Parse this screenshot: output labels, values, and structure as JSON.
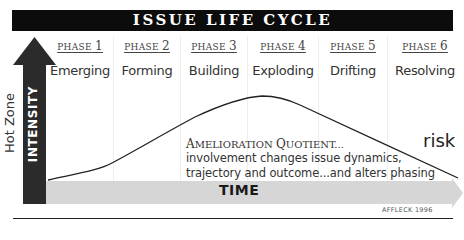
{
  "title": "ISSUE LIFE CYCLE",
  "phases": [
    {
      "label": "PHASE",
      "number": "1",
      "name": "Emerging"
    },
    {
      "label": "PHASE",
      "number": "2",
      "name": "Forming"
    },
    {
      "label": "PHASE",
      "number": "3",
      "name": "Building"
    },
    {
      "label": "PHASE",
      "number": "4",
      "name": "Exploding"
    },
    {
      "label": "PHASE",
      "number": "5",
      "name": "Drifting"
    },
    {
      "label": "PHASE",
      "number": "6",
      "name": "Resolving"
    }
  ],
  "y_axis": {
    "label": "INTENSITY",
    "side_label": "Hot Zone"
  },
  "x_axis": {
    "label": "TIME"
  },
  "curve_label": "risk",
  "annotation": {
    "title_caps": "A",
    "title_small": "MELIORATION ",
    "title_caps2": "Q",
    "title_small2": "UOTIENT...",
    "line1": "involvement changes issue dynamics,",
    "line2": "trajectory and outcome...and alters phasing"
  },
  "credit": "AFFLECK 1996",
  "colors": {
    "title_bg": "#0c0c0c",
    "intensity_arrow": "#2b2b2b",
    "time_arrow": "#d6d6d6",
    "curve": "#222222"
  }
}
